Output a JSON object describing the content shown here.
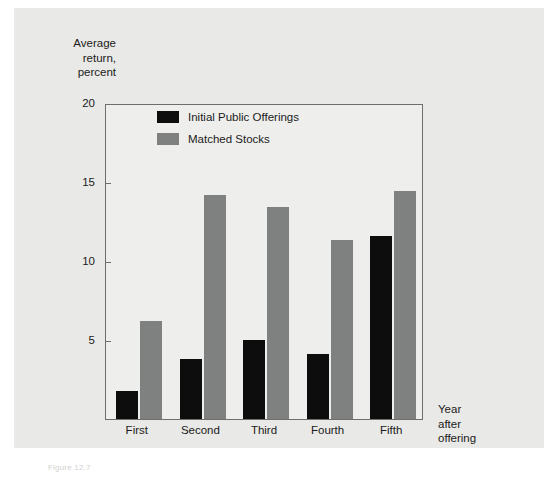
{
  "figure": {
    "caption": "Figure 12.7"
  },
  "chart_data": {
    "type": "bar",
    "title": "",
    "subtitle": "",
    "xlabel": "Year\nafter\noffering",
    "ylabel": "Average\nreturn,\npercent",
    "categories": [
      "First",
      "Second",
      "Third",
      "Fourth",
      "Fifth"
    ],
    "series": [
      {
        "name": "Initial Public Offerings",
        "color": "#0d0d0d",
        "values": [
          1.8,
          3.8,
          5.0,
          4.1,
          11.6
        ]
      },
      {
        "name": "Matched Stocks",
        "color": "#7f8080",
        "values": [
          6.2,
          14.2,
          13.4,
          11.3,
          14.4
        ]
      }
    ],
    "ylim": [
      0,
      20
    ],
    "yticks": [
      5,
      10,
      15,
      20
    ],
    "ytick_labels": [
      "5",
      "10",
      "15",
      "20"
    ],
    "grid": false,
    "legend_position": "top-left-inside",
    "plot_background": "#eeeeec",
    "panel_background": "#e9e9e7",
    "axis_color": "#6e6e6e"
  }
}
